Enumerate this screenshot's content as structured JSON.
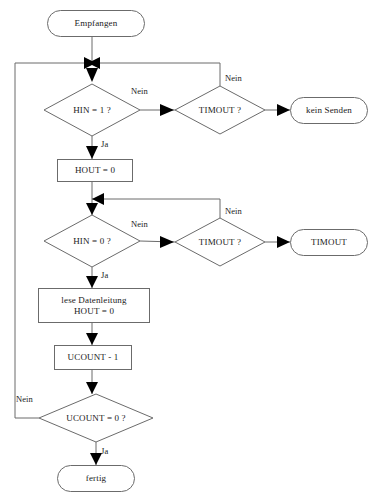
{
  "diagram": {
    "stroke_color": "#6b6b6b",
    "arrow_color": "#000000",
    "text_color": "#1a1a1a",
    "background_color": "#ffffff",
    "nodes": [
      {
        "id": "start",
        "shape": "terminator",
        "label": "Empfangen",
        "x": 47,
        "y": 10,
        "w": 98,
        "h": 27
      },
      {
        "id": "hin1",
        "shape": "decision",
        "label": "HIN = 1 ?",
        "x": 44,
        "y": 84,
        "w": 96,
        "h": 52
      },
      {
        "id": "timout1",
        "shape": "decision",
        "label": "TIMOUT ?",
        "x": 175,
        "y": 86,
        "w": 90,
        "h": 48
      },
      {
        "id": "kein_senden",
        "shape": "terminator",
        "label": "kein Senden",
        "x": 290,
        "y": 97,
        "w": 78,
        "h": 27
      },
      {
        "id": "hout0",
        "shape": "process",
        "label": "HOUT = 0",
        "x": 57,
        "y": 159,
        "w": 76,
        "h": 23
      },
      {
        "id": "hin0",
        "shape": "decision",
        "label": "HIN = 0 ?",
        "x": 44,
        "y": 215,
        "w": 96,
        "h": 52
      },
      {
        "id": "timout2",
        "shape": "decision",
        "label": "TIMOUT ?",
        "x": 175,
        "y": 218,
        "w": 90,
        "h": 48
      },
      {
        "id": "timout_end",
        "shape": "terminator",
        "label": "TIMOUT",
        "x": 290,
        "y": 229,
        "w": 78,
        "h": 27
      },
      {
        "id": "lese",
        "shape": "process",
        "label": "lese Datenleitung\nHOUT = 0",
        "x": 38,
        "y": 288,
        "w": 112,
        "h": 35
      },
      {
        "id": "ucount_dec",
        "shape": "process",
        "label": "UCOUNT - 1",
        "x": 54,
        "y": 345,
        "w": 78,
        "h": 25
      },
      {
        "id": "ucount_check",
        "shape": "decision",
        "label": "UCOUNT = 0 ?",
        "x": 39,
        "y": 394,
        "w": 114,
        "h": 48
      },
      {
        "id": "fertig",
        "shape": "terminator",
        "label": "fertig",
        "x": 57,
        "y": 465,
        "w": 78,
        "h": 27
      }
    ],
    "edge_labels": [
      {
        "id": "lbl-hin1-nein",
        "text": "Nein",
        "x": 131,
        "y": 86
      },
      {
        "id": "lbl-timout1-nein",
        "text": "Nein",
        "x": 225,
        "y": 73
      },
      {
        "id": "lbl-hin1-ja",
        "text": "Ja",
        "x": 101,
        "y": 139
      },
      {
        "id": "lbl-hin0-nein",
        "text": "Nein",
        "x": 131,
        "y": 219
      },
      {
        "id": "lbl-timout2-nein",
        "text": "Nein",
        "x": 225,
        "y": 206
      },
      {
        "id": "lbl-hin0-ja",
        "text": "Ja",
        "x": 101,
        "y": 270
      },
      {
        "id": "lbl-ucount-nein",
        "text": "Nein",
        "x": 16,
        "y": 394
      },
      {
        "id": "lbl-ucount-ja",
        "text": "Ja",
        "x": 101,
        "y": 446
      }
    ]
  }
}
